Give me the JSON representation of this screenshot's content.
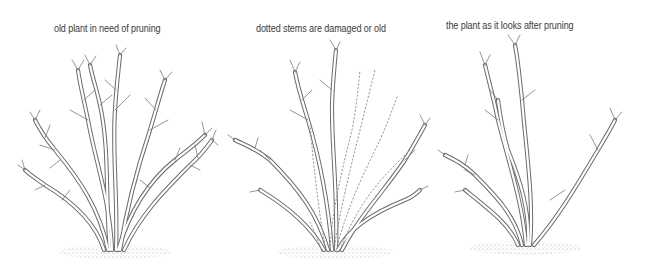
{
  "figure": {
    "panels": [
      {
        "id": "before",
        "caption": "old plant in need of pruning"
      },
      {
        "id": "marked",
        "caption": "dotted stems are damaged or old"
      },
      {
        "id": "after",
        "caption": "the plant as it looks after pruning"
      }
    ],
    "colors": {
      "background": "#ffffff",
      "stem_outline": "#6b6b6b",
      "caption_text": "#3a3a3a",
      "ground_stipple": "#9a9a9a"
    }
  }
}
